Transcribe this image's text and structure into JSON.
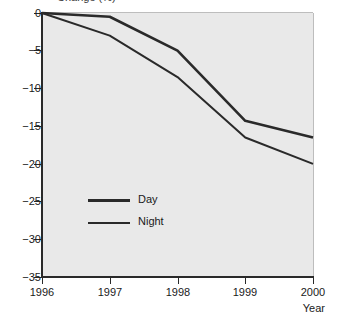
{
  "figure": {
    "clipped_axis_label": "Change (%)",
    "background_color": "#ffffff",
    "plot_background_color": "#e9e9e9",
    "line_color": "#2a2a2a"
  },
  "axes": {
    "y_tick_labels": [
      "0",
      "−5",
      "−10",
      "−15",
      "−20",
      "−25",
      "−30",
      "−35"
    ],
    "x_tick_labels": [
      "1996",
      "1997",
      "1998",
      "1999",
      "2000"
    ],
    "x_axis_title": "Year"
  },
  "legend": {
    "items": [
      {
        "label": "Day",
        "color": "#2a2a2a"
      },
      {
        "label": "Night",
        "color": "#2a2a2a"
      }
    ]
  },
  "chart_data": {
    "type": "line",
    "title": "",
    "subtitle": "",
    "xlabel": "Year",
    "ylabel": "Change (%)",
    "x": [
      1996,
      1997,
      1998,
      1999,
      2000
    ],
    "categories": [
      "1996",
      "1997",
      "1998",
      "1999",
      "2000"
    ],
    "series": [
      {
        "name": "Day",
        "values": [
          0,
          -0.5,
          -5.0,
          -14.3,
          -16.5
        ]
      },
      {
        "name": "Night",
        "values": [
          0,
          -3.0,
          -8.5,
          -16.5,
          -20.0
        ]
      }
    ],
    "xlim": [
      1996,
      2000
    ],
    "ylim": [
      -35,
      0
    ],
    "y_ticks": [
      0,
      -5,
      -10,
      -15,
      -20,
      -25,
      -30,
      -35
    ],
    "x_ticks": [
      1996,
      1997,
      1998,
      1999,
      2000
    ],
    "grid": false,
    "legend_position": "inside-lower-left"
  }
}
